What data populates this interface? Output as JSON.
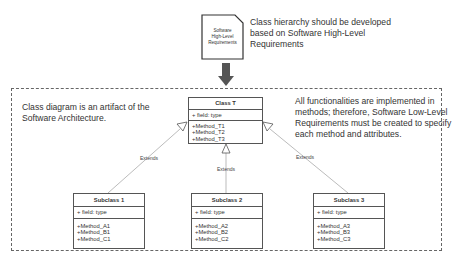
{
  "requirements_doc": {
    "label": "Software\nHigh-Level\nRequirements",
    "icon": "document-icon"
  },
  "notes": {
    "top": "Class hierarchy should be developed\nbased on Software High-Level\nRequirements",
    "left": "Class diagram is an artifact of the\nSoftware Architecture.",
    "right": "All functionalities are implemented in\nmethods; therefore, Software Low-Level\nRequirements must be created to specify\neach method and attributes."
  },
  "classes": {
    "parent": {
      "name": "Class T",
      "field": "+ field: type",
      "methods": [
        "+Method_T1",
        "+Method_T2",
        "+Method_T3"
      ]
    },
    "sub1": {
      "name": "Subclass 1",
      "field": "+ field: type",
      "methods": [
        "+Method_A1",
        "+Method_B1",
        "+Method_C1"
      ]
    },
    "sub2": {
      "name": "Subclass 2",
      "field": "+ field: type",
      "methods": [
        "+Method_A2",
        "+Method_B2",
        "+Method_C2"
      ]
    },
    "sub3": {
      "name": "Subclass 3",
      "field": "+ field: type",
      "methods": [
        "+Method_A3",
        "+Method_B3",
        "+Method_C3"
      ]
    }
  },
  "relations": {
    "extends_label": "Extends"
  },
  "colors": {
    "arrow": "#555555",
    "border": "#555555",
    "connector": "#aaaaaa"
  }
}
